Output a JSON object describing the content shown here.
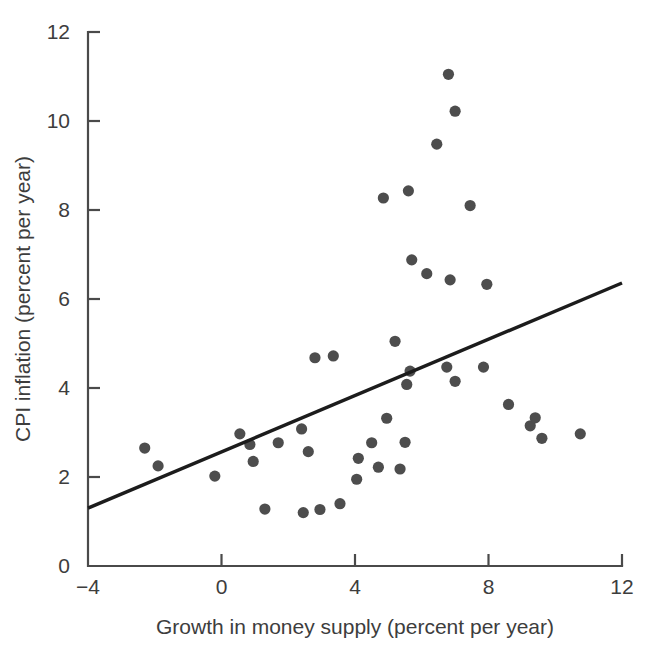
{
  "chart_data": {
    "type": "scatter",
    "title": "",
    "xlabel": "Growth in money supply (percent per year)",
    "ylabel": "CPI inflation (percent per year)",
    "xlim": [
      -4,
      12
    ],
    "ylim": [
      0,
      12
    ],
    "xticks": [
      -4,
      0,
      4,
      8,
      12
    ],
    "yticks": [
      0,
      2,
      4,
      6,
      8,
      10,
      12
    ],
    "xtick_labels": [
      "−4",
      "0",
      "4",
      "8",
      "12"
    ],
    "ytick_labels": [
      "0",
      "2",
      "4",
      "6",
      "8",
      "10",
      "12"
    ],
    "grid": false,
    "legend": "none",
    "point_color": "#4d4d4d",
    "line_color": "#1c1c1c",
    "axis_color": "#4a4a4a",
    "points": [
      [
        -2.3,
        2.65
      ],
      [
        -1.9,
        2.25
      ],
      [
        -0.2,
        2.02
      ],
      [
        0.55,
        2.97
      ],
      [
        0.85,
        2.73
      ],
      [
        0.95,
        2.35
      ],
      [
        1.3,
        1.28
      ],
      [
        1.7,
        2.77
      ],
      [
        2.4,
        3.08
      ],
      [
        2.45,
        1.2
      ],
      [
        2.6,
        2.57
      ],
      [
        2.8,
        4.68
      ],
      [
        2.95,
        1.27
      ],
      [
        3.35,
        4.72
      ],
      [
        3.55,
        1.4
      ],
      [
        4.05,
        1.95
      ],
      [
        4.1,
        2.42
      ],
      [
        4.5,
        2.77
      ],
      [
        4.7,
        2.22
      ],
      [
        4.85,
        8.27
      ],
      [
        4.95,
        3.32
      ],
      [
        5.2,
        5.05
      ],
      [
        5.35,
        2.18
      ],
      [
        5.5,
        2.78
      ],
      [
        5.55,
        4.08
      ],
      [
        5.6,
        8.43
      ],
      [
        5.65,
        4.38
      ],
      [
        5.7,
        6.88
      ],
      [
        6.15,
        6.57
      ],
      [
        6.45,
        9.48
      ],
      [
        6.75,
        4.47
      ],
      [
        6.8,
        11.05
      ],
      [
        6.85,
        6.43
      ],
      [
        7.0,
        10.22
      ],
      [
        7.0,
        4.15
      ],
      [
        7.45,
        8.1
      ],
      [
        7.85,
        4.47
      ],
      [
        7.95,
        6.33
      ],
      [
        8.6,
        3.63
      ],
      [
        9.25,
        3.15
      ],
      [
        9.4,
        3.33
      ],
      [
        9.6,
        2.87
      ],
      [
        10.75,
        2.97
      ]
    ],
    "trend_line": {
      "x_start": -4,
      "y_start": 1.3,
      "x_end": 12,
      "y_end": 6.36,
      "slope": 0.3163,
      "intercept": 2.565
    }
  },
  "geometry": {
    "plot_left": 88,
    "plot_right": 622,
    "plot_bottom": 566,
    "plot_top": 32
  }
}
